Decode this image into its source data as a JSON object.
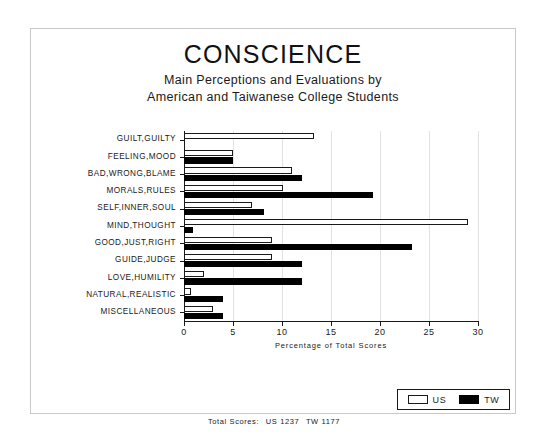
{
  "chart_data": {
    "type": "bar",
    "orientation": "horizontal",
    "title": "CONSCIENCE",
    "subtitle_line1": "Main Perceptions and Evaluations by",
    "subtitle_line2": "American and Taiwanese College Students",
    "xlabel": "Percentage of Total Scores",
    "ylabel": "",
    "xlim": [
      0,
      30
    ],
    "xticks": [
      0,
      5,
      10,
      15,
      20,
      25,
      30
    ],
    "xtick_labels": [
      "0",
      "5",
      "10",
      "15",
      "20",
      "25",
      "30"
    ],
    "grid": true,
    "legend_position": "bottom-right",
    "categories": [
      "GUILT,GUILTY",
      "FEELING,MOOD",
      "BAD,WRONG,BLAME",
      "MORALS,RULES",
      "SELF,INNER,SOUL",
      "MIND,THOUGHT",
      "GOOD,JUST,RIGHT",
      "GUIDE,JUDGE",
      "LOVE,HUMILITY",
      "NATURAL,REALISTIC",
      "MISCELLANEOUS"
    ],
    "series": [
      {
        "name": "US",
        "color": "#ffffff",
        "edge_color": "#1a1a1a",
        "values": [
          13.3,
          5.0,
          11.0,
          10.1,
          6.9,
          29.0,
          9.0,
          9.0,
          2.0,
          0.7,
          3.0
        ]
      },
      {
        "name": "TW",
        "color": "#000000",
        "edge_color": "#000000",
        "values": [
          0.0,
          5.0,
          12.0,
          19.3,
          8.2,
          0.9,
          23.3,
          12.0,
          12.0,
          4.0,
          4.0
        ]
      }
    ],
    "annotations": {
      "total_scores_label": "Total Scores:",
      "total_us": "US 1237",
      "total_tw": "TW 1177"
    }
  },
  "legend": {
    "entries": [
      {
        "label": "US",
        "swatch": "open-square-swatch"
      },
      {
        "label": "TW",
        "swatch": "filled-square-swatch"
      }
    ]
  }
}
